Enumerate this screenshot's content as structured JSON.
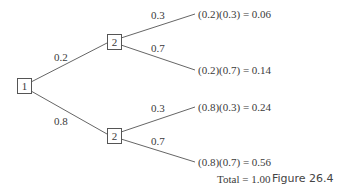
{
  "diagram": {
    "type": "probability-tree",
    "root": {
      "label": "1"
    },
    "branches": [
      {
        "probability": "0.2",
        "node": {
          "label": "2"
        },
        "children": [
          {
            "probability": "0.3",
            "result": "(0.2)(0.3) = 0.06"
          },
          {
            "probability": "0.7",
            "result": "(0.2)(0.7) = 0.14"
          }
        ]
      },
      {
        "probability": "0.8",
        "node": {
          "label": "2"
        },
        "children": [
          {
            "probability": "0.3",
            "result": "(0.8)(0.3) = 0.24"
          },
          {
            "probability": "0.7",
            "result": "(0.8)(0.7) = 0.56"
          }
        ]
      }
    ],
    "total": "Total = 1.00",
    "caption": "Figure 26.4"
  }
}
